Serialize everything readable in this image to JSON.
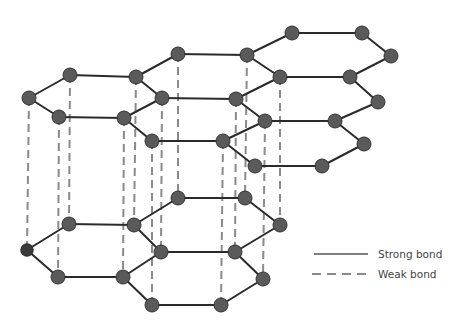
{
  "diagram": {
    "colors": {
      "background": "#ffffff",
      "strong_bond": "#2a2a2a",
      "weak_bond": "#8a8a8a",
      "atom_fill": "#5a5a5a",
      "atom_stroke": "#333333",
      "atom_dark_fill": "#3a3a3a"
    },
    "legend": {
      "strong_label": "Strong bond",
      "weak_label": "Weak bond"
    },
    "top_layer": {
      "atoms": [
        [
          29,
          98
        ],
        [
          70,
          75
        ],
        [
          136,
          77
        ],
        [
          162,
          98
        ],
        [
          124,
          118
        ],
        [
          59,
          117
        ],
        [
          178,
          54
        ],
        [
          247,
          55
        ],
        [
          280,
          77
        ],
        [
          236,
          99
        ],
        [
          292,
          33
        ],
        [
          362,
          33
        ],
        [
          391,
          56
        ],
        [
          350,
          77
        ],
        [
          378,
          102
        ],
        [
          335,
          121
        ],
        [
          265,
          121
        ],
        [
          152,
          141
        ],
        [
          223,
          141
        ],
        [
          364,
          144
        ],
        [
          322,
          166
        ],
        [
          255,
          166
        ]
      ],
      "bonds": [
        [
          0,
          1
        ],
        [
          1,
          2
        ],
        [
          2,
          3
        ],
        [
          3,
          4
        ],
        [
          4,
          5
        ],
        [
          5,
          0
        ],
        [
          2,
          6
        ],
        [
          6,
          7
        ],
        [
          7,
          8
        ],
        [
          8,
          9
        ],
        [
          9,
          3
        ],
        [
          7,
          10
        ],
        [
          10,
          11
        ],
        [
          11,
          12
        ],
        [
          12,
          13
        ],
        [
          13,
          8
        ],
        [
          13,
          14
        ],
        [
          14,
          15
        ],
        [
          15,
          16
        ],
        [
          16,
          9
        ],
        [
          4,
          17
        ],
        [
          17,
          18
        ],
        [
          18,
          16
        ],
        [
          15,
          19
        ],
        [
          19,
          20
        ],
        [
          20,
          21
        ],
        [
          21,
          18
        ]
      ]
    },
    "bottom_layer": {
      "atoms": [
        [
          27,
          250
        ],
        [
          69,
          224
        ],
        [
          134,
          225
        ],
        [
          161,
          252
        ],
        [
          123,
          277
        ],
        [
          58,
          277
        ],
        [
          178,
          198
        ],
        [
          245,
          198
        ],
        [
          280,
          225
        ],
        [
          235,
          252
        ],
        [
          263,
          279
        ],
        [
          221,
          305
        ],
        [
          152,
          305
        ]
      ],
      "bonds": [
        [
          0,
          1
        ],
        [
          1,
          2
        ],
        [
          2,
          3
        ],
        [
          3,
          4
        ],
        [
          4,
          5
        ],
        [
          5,
          0
        ],
        [
          2,
          6
        ],
        [
          6,
          7
        ],
        [
          7,
          8
        ],
        [
          8,
          9
        ],
        [
          9,
          3
        ],
        [
          9,
          10
        ],
        [
          10,
          11
        ],
        [
          11,
          12
        ],
        [
          12,
          4
        ]
      ],
      "dark_atom_index": 0
    },
    "weak_bonds": [
      [
        29,
        98,
        27,
        250
      ],
      [
        59,
        117,
        58,
        277
      ],
      [
        70,
        75,
        69,
        224
      ],
      [
        124,
        118,
        123,
        277
      ],
      [
        136,
        77,
        134,
        225
      ],
      [
        152,
        141,
        152,
        305
      ],
      [
        162,
        98,
        161,
        252
      ],
      [
        178,
        54,
        178,
        198
      ],
      [
        223,
        141,
        221,
        305
      ],
      [
        236,
        99,
        235,
        252
      ],
      [
        247,
        55,
        245,
        198
      ],
      [
        265,
        121,
        263,
        279
      ],
      [
        280,
        77,
        280,
        225
      ]
    ]
  }
}
